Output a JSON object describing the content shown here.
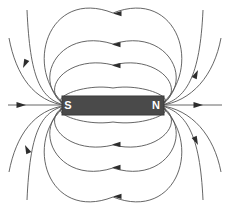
{
  "diagram": {
    "background_color": "#ffffff",
    "line_color": "#555555",
    "magnet": {
      "name": "bar-magnet",
      "fill_color": "#4a4a4a",
      "stroke_color": "#3a3a3a",
      "x": 62,
      "y": 96,
      "width": 102,
      "height": 19,
      "south_pole_label": "S",
      "north_pole_label": "N",
      "south_label_x": 68,
      "north_label_x": 156,
      "label_y": 106
    },
    "axis_line": {
      "name": "magnetic-axis-line",
      "y": 105,
      "left_start_x": 8,
      "left_end_x": 62,
      "right_start_x": 164,
      "right_end_x": 222,
      "left_arrow_x": 26,
      "right_arrow_x": 203,
      "arrow_direction": "right"
    },
    "field_lines": {
      "name": "magnetic-field-lines",
      "loop_count_per_side": 4,
      "flow_direction": "north-to-south",
      "top_loops": [
        {
          "id": "top-loop-1",
          "apex_y": 88,
          "half_width": 38,
          "arrow": false
        },
        {
          "id": "top-loop-2",
          "apex_y": 65,
          "half_width": 57,
          "arrow": true,
          "arrow_x": 112
        },
        {
          "id": "top-loop-3",
          "apex_y": 44,
          "half_width": 70,
          "arrow": true,
          "arrow_x": 112
        },
        {
          "id": "top-loop-4",
          "apex_y": 13,
          "half_width": 84,
          "arrow": true,
          "arrow_x": 113
        }
      ],
      "bottom_loops": [
        {
          "id": "bottom-loop-1",
          "apex_y": 122,
          "half_width": 38,
          "arrow": false
        },
        {
          "id": "bottom-loop-2",
          "apex_y": 145,
          "half_width": 57,
          "arrow": true,
          "arrow_x": 112
        },
        {
          "id": "bottom-loop-3",
          "apex_y": 168,
          "half_width": 70,
          "arrow": true,
          "arrow_x": 112
        },
        {
          "id": "bottom-loop-4",
          "apex_y": 197,
          "half_width": 84,
          "arrow": true,
          "arrow_x": 113
        }
      ],
      "outer_curves": [
        {
          "id": "outer-curve-top-left",
          "arrow_x": 23,
          "arrow_y": 68,
          "arrow_angle": 115
        },
        {
          "id": "outer-curve-top-right",
          "arrow_x": 198,
          "arrow_y": 70,
          "arrow_angle": 295
        },
        {
          "id": "outer-curve-bottom-left",
          "arrow_x": 25,
          "arrow_y": 145,
          "arrow_angle": 245
        },
        {
          "id": "outer-curve-bottom-right",
          "arrow_x": 198,
          "arrow_y": 145,
          "arrow_angle": 65
        }
      ]
    }
  }
}
